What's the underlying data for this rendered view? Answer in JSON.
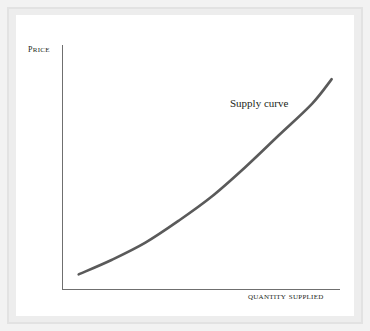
{
  "figure": {
    "background_color": "#ffffff",
    "frame_color": "#e2e2e2",
    "axis_color": "#6f6f6f",
    "curve_color": "#5a5a5a",
    "text_color": "#231f20"
  },
  "labels": {
    "y_axis": "Price",
    "x_axis": "Quantity supplied",
    "curve": "Supply curve"
  },
  "chart_data": {
    "type": "line",
    "title": "",
    "subtitle": "",
    "xlabel": "Quantity supplied",
    "ylabel": "Price",
    "grid": false,
    "legend_position": "inline-annotation",
    "axis_ticks": {
      "x": [],
      "y": []
    },
    "axis_arrows": false,
    "annotations": [
      {
        "text": "Supply curve",
        "x": 0.64,
        "y": 0.82,
        "anchor": "left"
      }
    ],
    "series": [
      {
        "name": "Supply curve",
        "color": "#5a5a5a",
        "line_width": 2.6,
        "description": "Upward-sloping convex supply curve: price rises with quantity supplied at an increasing rate",
        "x": [
          0.06,
          0.18,
          0.3,
          0.42,
          0.54,
          0.66,
          0.78,
          0.9,
          0.97
        ],
        "y": [
          0.06,
          0.12,
          0.19,
          0.28,
          0.38,
          0.5,
          0.63,
          0.76,
          0.86
        ]
      }
    ],
    "xlim": [
      0,
      1
    ],
    "ylim": [
      0,
      1
    ]
  }
}
